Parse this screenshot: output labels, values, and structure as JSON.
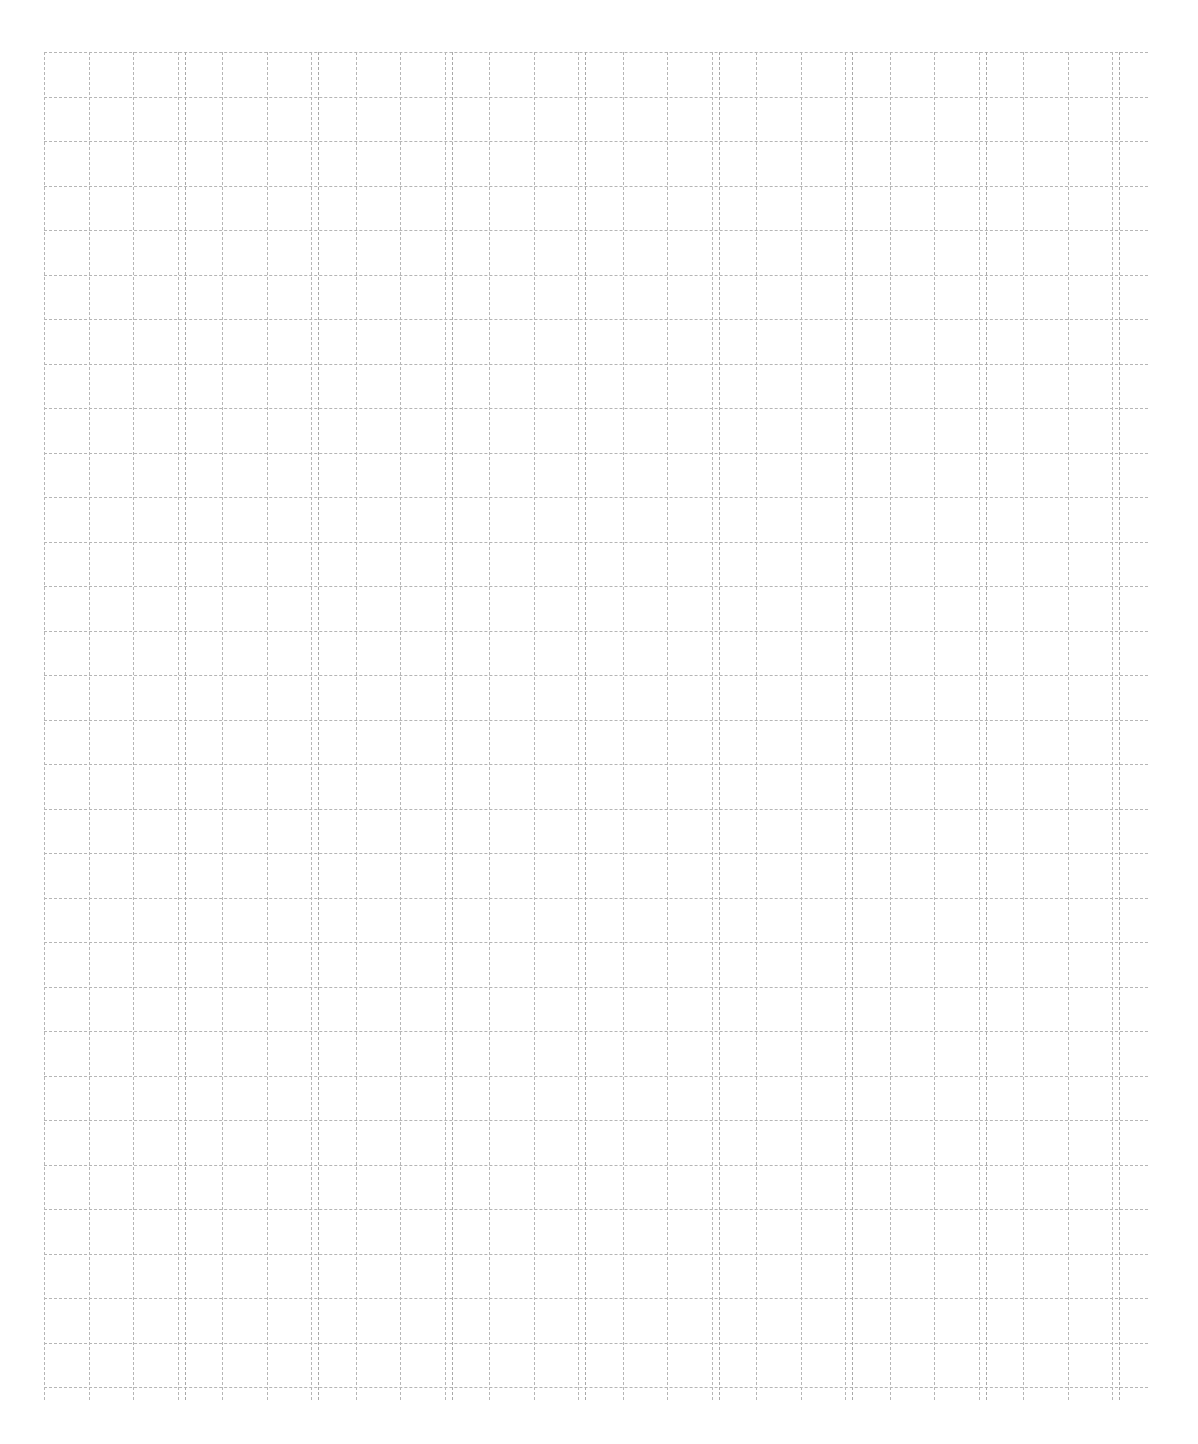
{
  "document": {
    "title": "Cursive Letter Practice Worksheet",
    "kind": "handwriting-practice-sheet",
    "script_style": "Copperplate cursive",
    "practice_letter": "a",
    "letter_case": "lowercase",
    "background_color": "#ffffff",
    "ink_color": "#1d1d1d"
  },
  "grid": {
    "line_color": "#b6b6b6",
    "major_line_color": "#a9a9a9",
    "line_style": "dashed",
    "origin_x": 44,
    "origin_y": 52,
    "width": 1104,
    "height": 1348,
    "cell_size": 44.5,
    "columns": 25,
    "rows": 31,
    "double_line_columns": [
      3,
      6,
      9,
      12,
      15,
      18,
      21,
      24
    ],
    "double_line_offset": 7
  },
  "letter_row": {
    "count": 8,
    "spacing": 137,
    "start_x": 50,
    "baseline_y": 63,
    "letters": [
      {
        "char": "a",
        "index": 1
      },
      {
        "char": "a",
        "index": 2
      },
      {
        "char": "a",
        "index": 3
      },
      {
        "char": "a",
        "index": 4
      },
      {
        "char": "a",
        "index": 5
      },
      {
        "char": "a",
        "index": 6
      },
      {
        "char": "a",
        "index": 7
      },
      {
        "char": "a",
        "index": 8
      }
    ]
  }
}
